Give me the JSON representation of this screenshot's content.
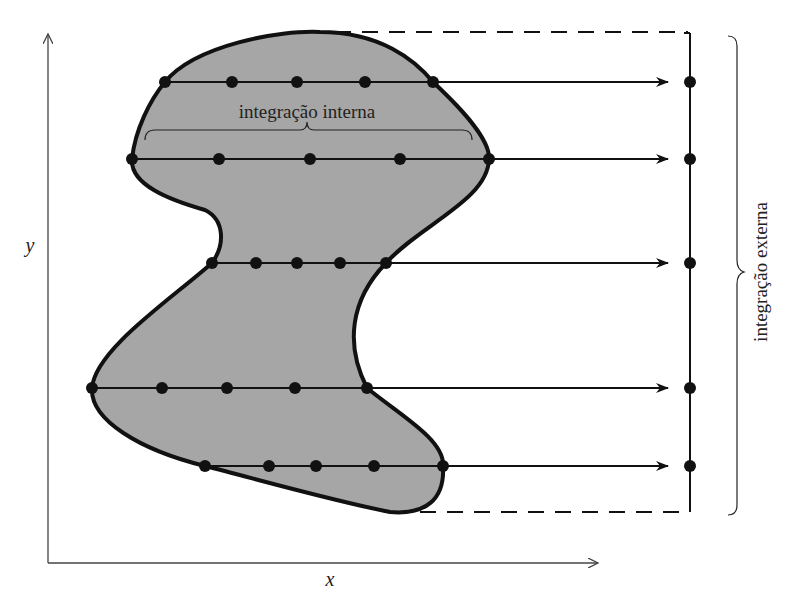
{
  "diagram": {
    "title": "",
    "labels": {
      "y_axis": "y",
      "x_axis": "x",
      "inner": "integração interna",
      "outer": "integração externa"
    },
    "colors": {
      "region_fill": "#a6a6a6",
      "stroke": "#111111",
      "axis": "#444444",
      "background": "#ffffff"
    },
    "rows": [
      {
        "y": 82,
        "dots_x": [
          165,
          232,
          297,
          365,
          433
        ],
        "outer_dot_x": 690
      },
      {
        "y": 159,
        "dots_x": [
          132,
          219,
          310,
          400,
          489
        ],
        "outer_dot_x": 690
      },
      {
        "y": 263,
        "dots_x": [
          212,
          256,
          297,
          340,
          386
        ],
        "outer_dot_x": 690
      },
      {
        "y": 388,
        "dots_x": [
          92,
          162,
          227,
          295,
          367
        ],
        "outer_dot_x": 690
      },
      {
        "y": 466,
        "dots_x": [
          205,
          269,
          316,
          374,
          443
        ],
        "outer_dot_x": 690
      }
    ]
  }
}
